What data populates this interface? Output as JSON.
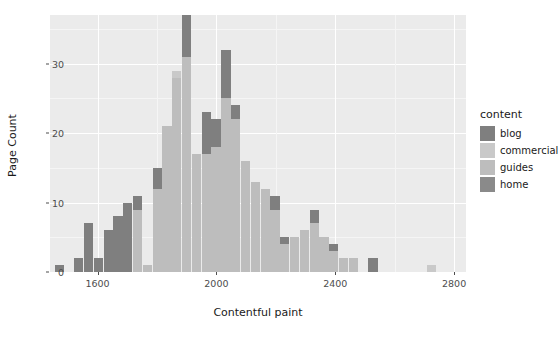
{
  "chart_data": {
    "type": "bar",
    "subtype": "stacked-histogram",
    "title": "",
    "xlabel": "Contentful paint",
    "ylabel": "Page Count",
    "xlim": [
      1440,
      2840
    ],
    "ylim": [
      0,
      37
    ],
    "xticks": [
      1600,
      2000,
      2400,
      2800
    ],
    "yticks": [
      0,
      10,
      20,
      30
    ],
    "grid": true,
    "legend": {
      "title": "content",
      "position": "right",
      "entries": [
        {
          "name": "blog",
          "color": "#7f7f7f"
        },
        {
          "name": "commercial",
          "color": "#c9c9c9"
        },
        {
          "name": "guides",
          "color": "#bdbdbd"
        },
        {
          "name": "home",
          "color": "#8a8a8a"
        }
      ]
    },
    "bin_width": 33,
    "bins": [
      {
        "x": 1472,
        "blog": 1,
        "commercial": 0,
        "guides": 0,
        "home": 0
      },
      {
        "x": 1505,
        "blog": 0,
        "commercial": 0,
        "guides": 0,
        "home": 0
      },
      {
        "x": 1538,
        "blog": 2,
        "commercial": 0,
        "guides": 0,
        "home": 0
      },
      {
        "x": 1571,
        "blog": 7,
        "commercial": 0,
        "guides": 0,
        "home": 0
      },
      {
        "x": 1604,
        "blog": 2,
        "commercial": 0,
        "guides": 0,
        "home": 0
      },
      {
        "x": 1637,
        "blog": 6,
        "commercial": 0,
        "guides": 0,
        "home": 0
      },
      {
        "x": 1670,
        "blog": 8,
        "commercial": 0,
        "guides": 0,
        "home": 0
      },
      {
        "x": 1703,
        "blog": 10,
        "commercial": 0,
        "guides": 0,
        "home": 0
      },
      {
        "x": 1736,
        "blog": 2,
        "commercial": 0,
        "guides": 9,
        "home": 0
      },
      {
        "x": 1769,
        "blog": 0,
        "commercial": 0,
        "guides": 1,
        "home": 0
      },
      {
        "x": 1802,
        "blog": 3,
        "commercial": 0,
        "guides": 12,
        "home": 0
      },
      {
        "x": 1835,
        "blog": 0,
        "commercial": 0,
        "guides": 21,
        "home": 0
      },
      {
        "x": 1868,
        "blog": 0,
        "commercial": 1,
        "guides": 28,
        "home": 0
      },
      {
        "x": 1901,
        "blog": 6,
        "commercial": 0,
        "guides": 31,
        "home": 0
      },
      {
        "x": 1934,
        "blog": 0,
        "commercial": 0,
        "guides": 17,
        "home": 0
      },
      {
        "x": 1967,
        "blog": 6,
        "commercial": 0,
        "guides": 17,
        "home": 0
      },
      {
        "x": 2000,
        "blog": 4,
        "commercial": 0,
        "guides": 18,
        "home": 0
      },
      {
        "x": 2033,
        "blog": 7,
        "commercial": 0,
        "guides": 25,
        "home": 0
      },
      {
        "x": 2066,
        "blog": 2,
        "commercial": 0,
        "guides": 22,
        "home": 0
      },
      {
        "x": 2099,
        "blog": 0,
        "commercial": 0,
        "guides": 16,
        "home": 0
      },
      {
        "x": 2132,
        "blog": 0,
        "commercial": 0,
        "guides": 13,
        "home": 0
      },
      {
        "x": 2165,
        "blog": 0,
        "commercial": 0,
        "guides": 12,
        "home": 0
      },
      {
        "x": 2198,
        "blog": 2,
        "commercial": 0,
        "guides": 9,
        "home": 0
      },
      {
        "x": 2231,
        "blog": 1,
        "commercial": 0,
        "guides": 4,
        "home": 0
      },
      {
        "x": 2264,
        "blog": 0,
        "commercial": 0,
        "guides": 5,
        "home": 0
      },
      {
        "x": 2297,
        "blog": 0,
        "commercial": 0,
        "guides": 6,
        "home": 0
      },
      {
        "x": 2330,
        "blog": 2,
        "commercial": 0,
        "guides": 7,
        "home": 0
      },
      {
        "x": 2363,
        "blog": 0,
        "commercial": 0,
        "guides": 5,
        "home": 0
      },
      {
        "x": 2396,
        "blog": 1,
        "commercial": 0,
        "guides": 3,
        "home": 0
      },
      {
        "x": 2429,
        "blog": 0,
        "commercial": 0,
        "guides": 2,
        "home": 0
      },
      {
        "x": 2462,
        "blog": 0,
        "commercial": 0,
        "guides": 2,
        "home": 0
      },
      {
        "x": 2495,
        "blog": 0,
        "commercial": 0,
        "guides": 0,
        "home": 0
      },
      {
        "x": 2528,
        "blog": 2,
        "commercial": 0,
        "guides": 0,
        "home": 0
      },
      {
        "x": 2561,
        "blog": 0,
        "commercial": 0,
        "guides": 0,
        "home": 0
      },
      {
        "x": 2594,
        "blog": 0,
        "commercial": 0,
        "guides": 0,
        "home": 0
      },
      {
        "x": 2627,
        "blog": 0,
        "commercial": 0,
        "guides": 0,
        "home": 0
      },
      {
        "x": 2660,
        "blog": 0,
        "commercial": 0,
        "guides": 0,
        "home": 0
      },
      {
        "x": 2693,
        "blog": 0,
        "commercial": 0,
        "guides": 0,
        "home": 0
      },
      {
        "x": 2726,
        "blog": 0,
        "commercial": 1,
        "guides": 0,
        "home": 0
      }
    ]
  },
  "style": {
    "panel_background": "#ebebeb",
    "gridline_major": "#ffffff",
    "gridline_minor": "#f5f5f5",
    "page_background": "#ffffff",
    "axis_text": "#4d4d4d",
    "title_text": "#1a1a1a"
  }
}
